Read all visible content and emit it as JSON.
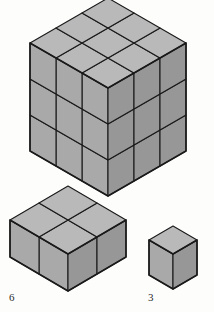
{
  "figure": {
    "background_color": "#fdfdfb",
    "stroke_color": "#1a1a1a",
    "colors": {
      "top_face": "#b9b9b9",
      "left_face": "#a9a9a9",
      "right_face": "#979797",
      "outline": "#1a1a1a",
      "label": "#2b2b2b"
    },
    "projection": {
      "type": "isometric",
      "unit_half_width": 26,
      "unit_half_height": 15,
      "unit_height": 36
    },
    "solids": [
      {
        "name": "large-cube",
        "shape": "cube",
        "dimensions": {
          "x": 3,
          "y": 3,
          "z": 3
        },
        "unit_cubes": 27,
        "label": "",
        "origin": {
          "x": 108,
          "y": 196
        },
        "scale": {
          "half_width": 26,
          "half_height": 15,
          "height": 36
        }
      },
      {
        "name": "slab-block",
        "shape": "rectangular-prism",
        "dimensions": {
          "x": 2,
          "y": 2,
          "z": 1
        },
        "unit_cubes": 4,
        "label": "6",
        "origin": {
          "x": 68,
          "y": 291
        },
        "scale": {
          "half_width": 29,
          "half_height": 17,
          "height": 37
        }
      },
      {
        "name": "unit-cube",
        "shape": "cube",
        "dimensions": {
          "x": 1,
          "y": 1,
          "z": 1
        },
        "unit_cubes": 1,
        "label": "3",
        "origin": {
          "x": 173,
          "y": 289
        },
        "scale": {
          "half_width": 24,
          "half_height": 14,
          "height": 35
        }
      }
    ],
    "labels": [
      {
        "name": "label-6",
        "text": "6",
        "x": 9,
        "y": 301
      },
      {
        "name": "label-3",
        "text": "3",
        "x": 148,
        "y": 301
      }
    ]
  }
}
